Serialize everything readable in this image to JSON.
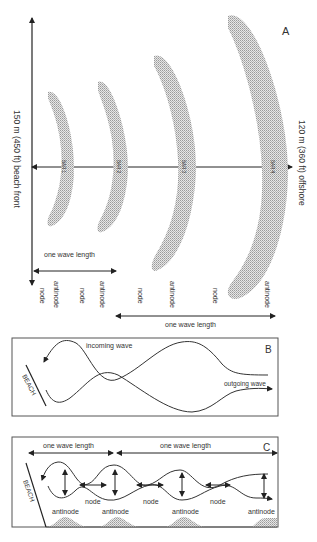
{
  "panel_a": {
    "letter": "A",
    "left_axis_label": "150 m (450 ft) beach front",
    "right_axis_label": "120 m (360 ft) offshore",
    "bars": [
      {
        "label": "BAR 1"
      },
      {
        "label": "BAR 2"
      },
      {
        "label": "BAR 3"
      },
      {
        "label": "BAR 4"
      }
    ],
    "wavelength_top": "one wave length",
    "wavelength_bottom": "one wave length",
    "positions": [
      "node",
      "antinode",
      "node",
      "antinode",
      "node",
      "antinode",
      "node",
      "antinode"
    ]
  },
  "panel_b": {
    "letter": "B",
    "beach": "BEACH",
    "incoming": "incoming wave",
    "outgoing": "outgoing wave"
  },
  "panel_c": {
    "letter": "C",
    "beach": "BEACH",
    "wavelength_1": "one wave length",
    "wavelength_2": "one wave length",
    "nodes": [
      "node",
      "node",
      "node"
    ],
    "antinodes": [
      "antinode",
      "antinode",
      "antinode",
      "antinode"
    ]
  },
  "colors": {
    "line": "#333333",
    "bar_fill": "#c8c8c8",
    "frame": "#555555"
  }
}
